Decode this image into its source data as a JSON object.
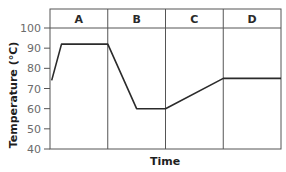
{
  "chart_data": {
    "type": "line",
    "title": "",
    "xlabel": "Time",
    "ylabel": "Temperature (°C)",
    "ylim": [
      40,
      100
    ],
    "yticks": [
      40,
      50,
      60,
      70,
      80,
      90,
      100
    ],
    "grid": false,
    "legend": null,
    "phases": [
      "A",
      "B",
      "C",
      "D"
    ],
    "series": [
      {
        "name": "Temperature",
        "points": [
          {
            "phase_pos": 0.03,
            "y": 74
          },
          {
            "phase_pos": 0.2,
            "y": 92
          },
          {
            "phase_pos": 1.0,
            "y": 92
          },
          {
            "phase_pos": 1.5,
            "y": 60
          },
          {
            "phase_pos": 2.0,
            "y": 60
          },
          {
            "phase_pos": 3.0,
            "y": 75
          },
          {
            "phase_pos": 4.0,
            "y": 75
          }
        ]
      }
    ],
    "annotations": [
      "Phase A: rapid rise to ~92 °C then plateau",
      "Phase B: drop to 60 °C then plateau",
      "Phase C: gradual rise to ~75 °C",
      "Phase D: plateau at ~75 °C"
    ]
  },
  "colors": {
    "line": "#2b2b2b",
    "frame": "#555555",
    "tick_text": "#6b6b6b"
  }
}
